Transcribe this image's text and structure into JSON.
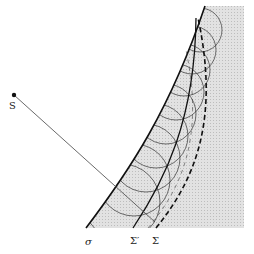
{
  "diagram": {
    "labels": {
      "source": "S",
      "surface": "σ",
      "wavefront_prime": "Σ′",
      "wavefront": "Σ"
    },
    "colors": {
      "line": "#222222",
      "shade": "#d8d8d8",
      "background": "#ffffff"
    }
  }
}
